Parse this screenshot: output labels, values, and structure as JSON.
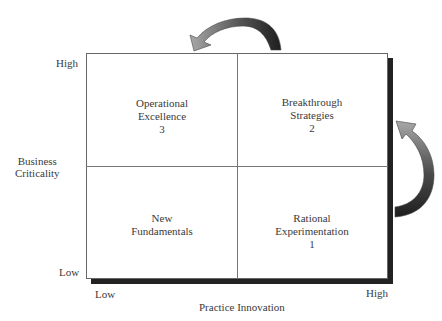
{
  "diagram": {
    "y_axis": {
      "title_line1": "Business",
      "title_line2": "Criticality",
      "high": "High",
      "low": "Low"
    },
    "x_axis": {
      "title": "Practice Innovation",
      "low": "Low",
      "high": "High"
    },
    "quadrants": [
      {
        "position": "top-left",
        "line1": "Operational",
        "line2": "Excellence",
        "number": "3"
      },
      {
        "position": "top-right",
        "line1": "Breakthrough",
        "line2": "Strategies",
        "number": "2"
      },
      {
        "position": "bottom-left",
        "line1": "New",
        "line2": "Fundamentals",
        "number": ""
      },
      {
        "position": "bottom-right",
        "line1": "Rational",
        "line2": "Experimentation",
        "number": "1"
      }
    ],
    "arrows": [
      {
        "name": "top-arrow",
        "direction": "from top-right quadrant to top-left quadrant"
      },
      {
        "name": "right-arrow",
        "direction": "from bottom-right quadrant to top-right quadrant"
      }
    ],
    "colors": {
      "shadow": "#222222",
      "arrow_light": "#9a9a9a",
      "arrow_dark": "#2a2a2a",
      "grid_line": "#777777"
    }
  }
}
